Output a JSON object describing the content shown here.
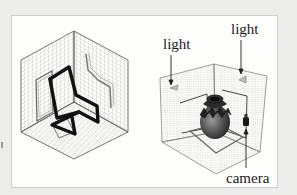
{
  "figure": {
    "left_panel": {
      "subject": "chair",
      "description": "Tubular cantilever chair inside an isometric gridded corner box with projected outlines on the walls and floor"
    },
    "right_panel": {
      "subject": "vase",
      "description": "Decorated vase inside a 3D gridded corner scene with two lights and a camera",
      "labels": {
        "light_left": "light",
        "light_right": "light",
        "camera": "camera"
      }
    }
  },
  "colors": {
    "background": "#ececea",
    "panel": "#fdfdfc",
    "grid": "#9c9c9c",
    "chair": "#111111",
    "text": "#1a1a1a"
  }
}
